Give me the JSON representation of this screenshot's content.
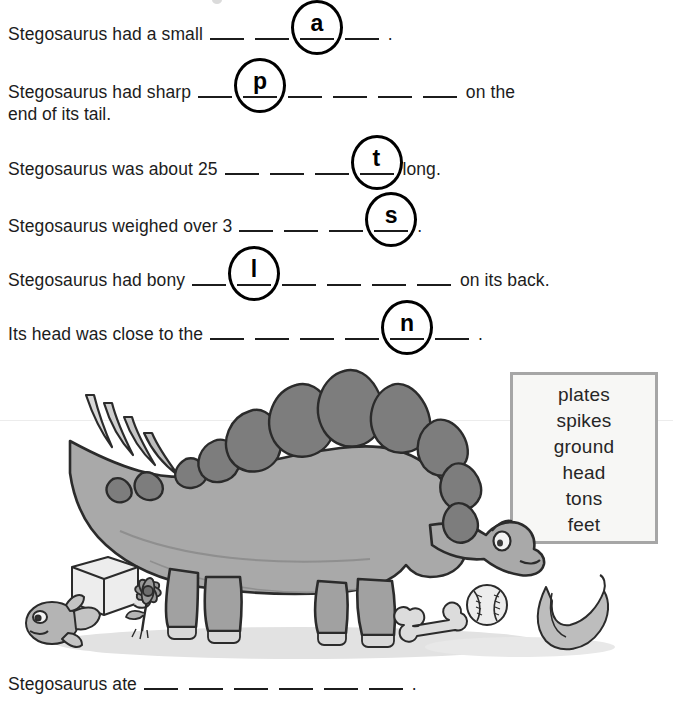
{
  "worksheet": {
    "sentences": [
      {
        "id": "sentence-1",
        "prefix": "Stegosaurus had a small",
        "suffix": ".",
        "blanks": 4,
        "circled_index": 3,
        "circled_letter": "a",
        "answer": "head"
      },
      {
        "id": "sentence-2",
        "prefix": "Stegosaurus had sharp",
        "suffix": "on the",
        "second_line": "end of its tail.",
        "blanks": 6,
        "circled_index": 2,
        "circled_letter": "p",
        "answer": "spikes"
      },
      {
        "id": "sentence-3",
        "prefix": "Stegosaurus was about 25",
        "suffix": "long.",
        "blanks": 4,
        "circled_index": 4,
        "circled_letter": "t",
        "answer": "feet"
      },
      {
        "id": "sentence-4",
        "prefix": "Stegosaurus weighed over 3",
        "suffix": ".",
        "blanks": 4,
        "circled_index": 4,
        "circled_letter": "s",
        "answer": "tons"
      },
      {
        "id": "sentence-5",
        "prefix": "Stegosaurus had bony",
        "suffix": "on its back.",
        "blanks": 6,
        "circled_index": 2,
        "circled_letter": "l",
        "answer": "plates"
      },
      {
        "id": "sentence-6",
        "prefix": "Its head was close to the",
        "suffix": ".",
        "blanks": 6,
        "circled_index": 5,
        "circled_letter": "n",
        "answer": "ground"
      },
      {
        "id": "sentence-7",
        "prefix": "Stegosaurus ate",
        "suffix": ".",
        "blanks": 6,
        "circled_index": 0,
        "circled_letter": "",
        "answer": ""
      }
    ],
    "word_bank": {
      "name": "word-bank",
      "words": [
        "plates",
        "spikes",
        "ground",
        "head",
        "tons",
        "feet"
      ]
    },
    "illustration": {
      "subject": "stegosaurus",
      "objects": [
        "ice-cube",
        "fish",
        "flower",
        "bone",
        "baseball",
        "banana"
      ],
      "colors": {
        "body": "#a9a9a9",
        "body_shadow": "#919191",
        "plates": "#7d7d7d",
        "outline": "#2b2b2b",
        "ground_shadow": "#dedede",
        "object_fill": "#c9c9c9",
        "object_light": "#e4e4e4"
      }
    },
    "colors": {
      "text": "#1c1c1c",
      "rule": "#1c1c1c",
      "box_border": "#a6a6a6",
      "box_fill": "#f7f7f5",
      "page": "#ffffff"
    }
  }
}
